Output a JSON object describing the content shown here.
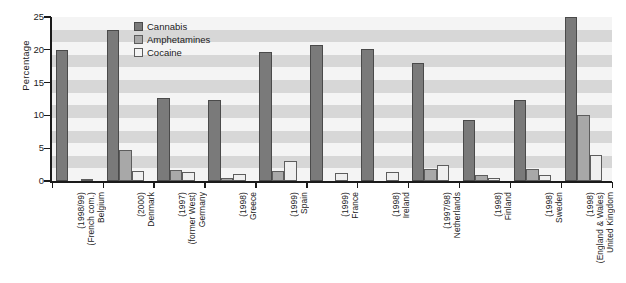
{
  "chart_data": {
    "type": "bar",
    "title": "",
    "xlabel": "",
    "ylabel": "Percentage",
    "ylim": [
      0,
      25
    ],
    "yticks": [
      0,
      5,
      10,
      15,
      20,
      25
    ],
    "grid": "horizontal alternating bands",
    "legend_position": "top-center-right inside plot",
    "categories": [
      "Belgium (French com.) (1998/99)",
      "Denmark (2000)",
      "Germany (former West) (1997)",
      "Greece (1998)",
      "Spain (1999)",
      "France (1999)",
      "Ireland (1998)",
      "Netherlands (1997/98)",
      "Finland (1998)",
      "Sweden (1998)",
      "United Kingdom (England & Wales) (1998)"
    ],
    "category_lines": [
      [
        "Belgium",
        "(French com.)",
        "(1998/99)"
      ],
      [
        "Denmark",
        "(2000)"
      ],
      [
        "Germany",
        "(former West)",
        "(1997)"
      ],
      [
        "Greece",
        "(1998)"
      ],
      [
        "Spain",
        "(1999)"
      ],
      [
        "France",
        "(1999)"
      ],
      [
        "Ireland",
        "(1998)"
      ],
      [
        "Netherlands",
        "(1997/98)"
      ],
      [
        "Finland",
        "(1998)"
      ],
      [
        "Sweden",
        "(1998)"
      ],
      [
        "United Kingdom",
        "(England & Wales)",
        "(1998)"
      ]
    ],
    "series": [
      {
        "name": "Cannabis",
        "color": "#7a7a7a",
        "values": [
          20.0,
          23.0,
          12.7,
          12.4,
          19.7,
          20.7,
          20.1,
          18.0,
          9.3,
          12.4,
          25.0
        ]
      },
      {
        "name": "Amphetamines",
        "color": "#a8a8a8",
        "values": [
          0.0,
          4.7,
          1.7,
          0.5,
          1.5,
          0.0,
          0.0,
          1.8,
          0.9,
          1.8,
          10.0
        ]
      },
      {
        "name": "Cocaine",
        "color": "#efefef",
        "values": [
          0.15,
          1.5,
          1.3,
          1.1,
          3.1,
          1.2,
          1.3,
          2.4,
          0.4,
          0.9,
          4.0
        ]
      }
    ]
  },
  "legend": {
    "items": [
      {
        "label": "Cannabis",
        "key": "cannabis"
      },
      {
        "label": "Amphetamines",
        "key": "amph"
      },
      {
        "label": "Cocaine",
        "key": "coca"
      }
    ]
  },
  "axis": {
    "y_title": "Percentage"
  }
}
